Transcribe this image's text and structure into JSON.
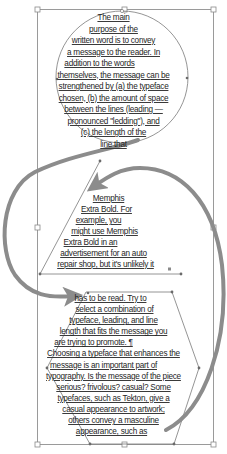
{
  "canvas": {
    "width": 227,
    "height": 454,
    "background": "#ffffff",
    "frame_color": "#9a9a9a",
    "arrow_color": "#8c8c8c",
    "shape_stroke": "#7a7a7a"
  },
  "text_frames": [
    {
      "shape": "circle",
      "lines": [
        "The main",
        "purpose of the",
        "written word is to convey",
        "a message to the reader. In",
        "addition to the words",
        "themselves, the message can be",
        "strengthened by (a) the typeface",
        "chosen, (b) the amount of space",
        "between the lines (leading —",
        "pronounced \"ledding\"), and",
        "(c) the length of the",
        "line that"
      ]
    },
    {
      "shape": "triangle",
      "lines": [
        "Memphis",
        "Extra Bold. For",
        "example, you",
        "might use Memphis",
        "Extra Bold in an",
        "advertisement for an auto",
        "repair shop, but it's unlikely it"
      ]
    },
    {
      "shape": "hexagon",
      "lines": [
        "has to be read. Try to",
        "select a combination of",
        "typeface, leading, and line",
        "length that fits the message you",
        "are trying to promote. ¶",
        "Choosing a typeface that enhances the",
        "message is an important part of",
        "typography. Is the message of the piece",
        "serious? frivolous? casual? Some",
        "typefaces, such as Tekton, give a",
        "casual appearance to artwork;",
        "others convey a masculine",
        "appearance, such as"
      ]
    }
  ],
  "threads": [
    {
      "from": "circle",
      "to": "triangle",
      "label": "text-thread-arrow"
    },
    {
      "from": "triangle",
      "to": "hexagon",
      "label": "text-thread-arrow"
    },
    {
      "from": "hexagon",
      "to": "triangle",
      "label": "text-thread-arrow"
    }
  ]
}
